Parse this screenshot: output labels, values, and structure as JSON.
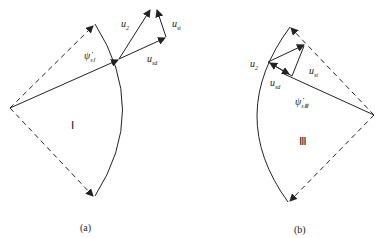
{
  "diagram": {
    "panel_a": {
      "caption": "(a)",
      "region_label": "Ⅰ",
      "flux_label": {
        "base": "ψ̇",
        "sub": "sⅠ"
      },
      "u2_label": {
        "base": "u",
        "sub": "2"
      },
      "ust_label": {
        "base": "u",
        "sub": "st"
      },
      "usd_label": {
        "base": "u",
        "sub": "sd"
      }
    },
    "panel_b": {
      "caption": "(b)",
      "region_label": "Ⅲ",
      "flux_label": {
        "base": "ψ̇",
        "sub": "sⅢ"
      },
      "u2_label": {
        "base": "u",
        "sub": "2"
      },
      "ust_label": {
        "base": "u",
        "sub": "st"
      },
      "usd_label": {
        "base": "u",
        "sub": "sd"
      }
    },
    "colors": {
      "stroke": "#222222",
      "background": "#ffffff"
    }
  }
}
